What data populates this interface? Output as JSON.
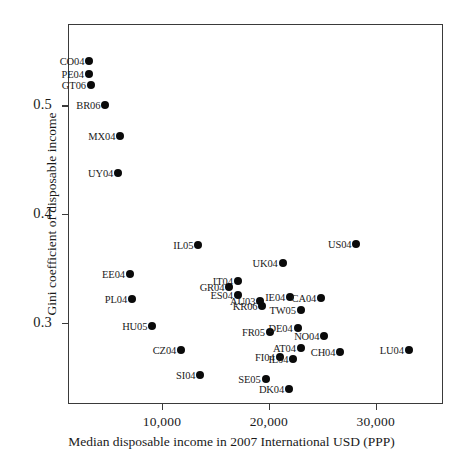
{
  "chart_data": {
    "type": "scatter",
    "title": "",
    "xlabel": "Median disposable income in 2007 International USD (PPP)",
    "ylabel": "Gini coefficient of disposable income",
    "xlim": [
      1200,
      36300
    ],
    "ylim": [
      0.225,
      0.575
    ],
    "xticks": [
      10000,
      20000,
      30000
    ],
    "xtick_labels": [
      "10,000",
      "20,000",
      "30,000"
    ],
    "yticks": [
      0.5,
      0.4,
      0.3
    ],
    "ytick_labels": [
      "0.5",
      "0.4",
      "0.3"
    ],
    "grid": false,
    "legend": "none",
    "point_color": "#0a0a0a",
    "frame_color": "#3a3a3a",
    "points": [
      {
        "label": "CO04",
        "x": 3200,
        "y": 0.541
      },
      {
        "label": "PE04",
        "x": 3150,
        "y": 0.529
      },
      {
        "label": "GT06",
        "x": 3350,
        "y": 0.519
      },
      {
        "label": "BR06",
        "x": 4700,
        "y": 0.5
      },
      {
        "label": "MX04",
        "x": 6100,
        "y": 0.472
      },
      {
        "label": "UY04",
        "x": 5900,
        "y": 0.438
      },
      {
        "label": "IL05",
        "x": 13400,
        "y": 0.371
      },
      {
        "label": "US04",
        "x": 28200,
        "y": 0.372
      },
      {
        "label": "UK04",
        "x": 21300,
        "y": 0.355
      },
      {
        "label": "EE04",
        "x": 7000,
        "y": 0.345
      },
      {
        "label": "IT04",
        "x": 17100,
        "y": 0.338
      },
      {
        "label": "GR04",
        "x": 16300,
        "y": 0.333
      },
      {
        "label": "PL04",
        "x": 7200,
        "y": 0.322
      },
      {
        "label": "ES04",
        "x": 17100,
        "y": 0.325
      },
      {
        "label": "AU03",
        "x": 19200,
        "y": 0.32
      },
      {
        "label": "IE04",
        "x": 22000,
        "y": 0.324
      },
      {
        "label": "CA04",
        "x": 24900,
        "y": 0.323
      },
      {
        "label": "KR06",
        "x": 19400,
        "y": 0.315
      },
      {
        "label": "TW05",
        "x": 23000,
        "y": 0.312
      },
      {
        "label": "HU05",
        "x": 9100,
        "y": 0.297
      },
      {
        "label": "FR05",
        "x": 20100,
        "y": 0.291
      },
      {
        "label": "DE04",
        "x": 22700,
        "y": 0.295
      },
      {
        "label": "NO04",
        "x": 25200,
        "y": 0.288
      },
      {
        "label": "CZ04",
        "x": 11800,
        "y": 0.275
      },
      {
        "label": "AT04",
        "x": 23000,
        "y": 0.277
      },
      {
        "label": "CH04",
        "x": 26700,
        "y": 0.273
      },
      {
        "label": "LU04",
        "x": 33100,
        "y": 0.275
      },
      {
        "label": "FI04",
        "x": 21000,
        "y": 0.268
      },
      {
        "label": "IL04",
        "x": 22300,
        "y": 0.266
      },
      {
        "label": "SI04",
        "x": 13600,
        "y": 0.252
      },
      {
        "label": "SE05",
        "x": 19700,
        "y": 0.248
      },
      {
        "label": "DK04",
        "x": 21900,
        "y": 0.239
      }
    ]
  }
}
